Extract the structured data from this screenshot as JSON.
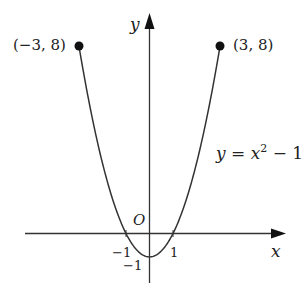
{
  "chart_data": {
    "type": "line",
    "title": "",
    "function": "y = x^2 - 1",
    "xlabel": "x",
    "ylabel": "y",
    "x_domain": [
      -3,
      3
    ],
    "origin_label": "O",
    "x_ticks": [
      -1,
      1
    ],
    "x_tick_labels": [
      "−1",
      "1"
    ],
    "y_ticks": [
      -1
    ],
    "y_tick_labels": [
      "−1"
    ],
    "grid": false,
    "series": [
      {
        "name": "y = x^2 - 1",
        "x": [
          -3,
          -2.5,
          -2,
          -1.5,
          -1,
          -0.5,
          0,
          0.5,
          1,
          1.5,
          2,
          2.5,
          3
        ],
        "y": [
          8,
          5.25,
          3,
          1.25,
          0,
          -0.75,
          -1,
          -0.75,
          0,
          1.25,
          3,
          5.25,
          8
        ]
      }
    ],
    "annotations": [
      {
        "text": "(−3, 8)",
        "x": -3,
        "y": 8,
        "marker": "filled-circle"
      },
      {
        "text": "(3, 8)",
        "x": 3,
        "y": 8,
        "marker": "filled-circle"
      },
      {
        "text": "y = x² − 1",
        "position": "right of curve"
      }
    ]
  },
  "labels": {
    "y_axis": "y",
    "x_axis": "x",
    "origin": "O",
    "left_point": "(−3, 8)",
    "right_point": "(3, 8)",
    "eq_y": "y",
    "eq_eq": " = ",
    "eq_x": "x",
    "eq_exp": "2",
    "eq_rest": " − 1",
    "tick_neg1_x": "−1",
    "tick_pos1_x": "1",
    "tick_neg1_y": "−1"
  },
  "colors": {
    "curve": "#333333",
    "axes": "#333333",
    "points": "#111111",
    "text": "#222222"
  }
}
